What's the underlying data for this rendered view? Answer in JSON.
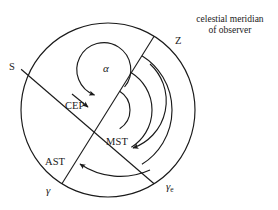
{
  "figure": {
    "type": "astronomical-diagram",
    "background_color": "#ffffff",
    "line_color": "#1a1a1a"
  },
  "caption": {
    "line1": "celestial meridian",
    "line2": "of observer"
  },
  "labels": {
    "zenith": "Z",
    "south": "S",
    "pole": "CEP",
    "mean_sidereal_time": "MST",
    "apparent_sidereal_time": "AST",
    "right_ascension": "α",
    "vernal_equinox": "γ",
    "vernal_equinox_mean": "γ",
    "vernal_equinox_mean_sub": "e"
  },
  "geometry": {
    "center": {
      "x": 108,
      "y": 110
    },
    "outer_circle_radius": 87,
    "arc_radii": [
      22,
      44,
      64
    ],
    "radial_lines": [
      {
        "name": "meridian-to-Z",
        "label": "Z",
        "angle_deg": -58
      },
      {
        "name": "radial-to-S",
        "label": "S",
        "angle_deg": 152
      },
      {
        "name": "radial-to-gamma",
        "label": "γ",
        "angle_deg": 109
      },
      {
        "name": "radial-to-gamma-e",
        "label": "γe",
        "angle_deg": 58
      }
    ]
  },
  "arc_arrows": [
    {
      "name": "alpha-arc",
      "label": "α",
      "radius": 22
    },
    {
      "name": "mst-arc",
      "label": "MST",
      "radius": 44
    },
    {
      "name": "ast-arc",
      "label": "AST",
      "radius": 64
    }
  ]
}
